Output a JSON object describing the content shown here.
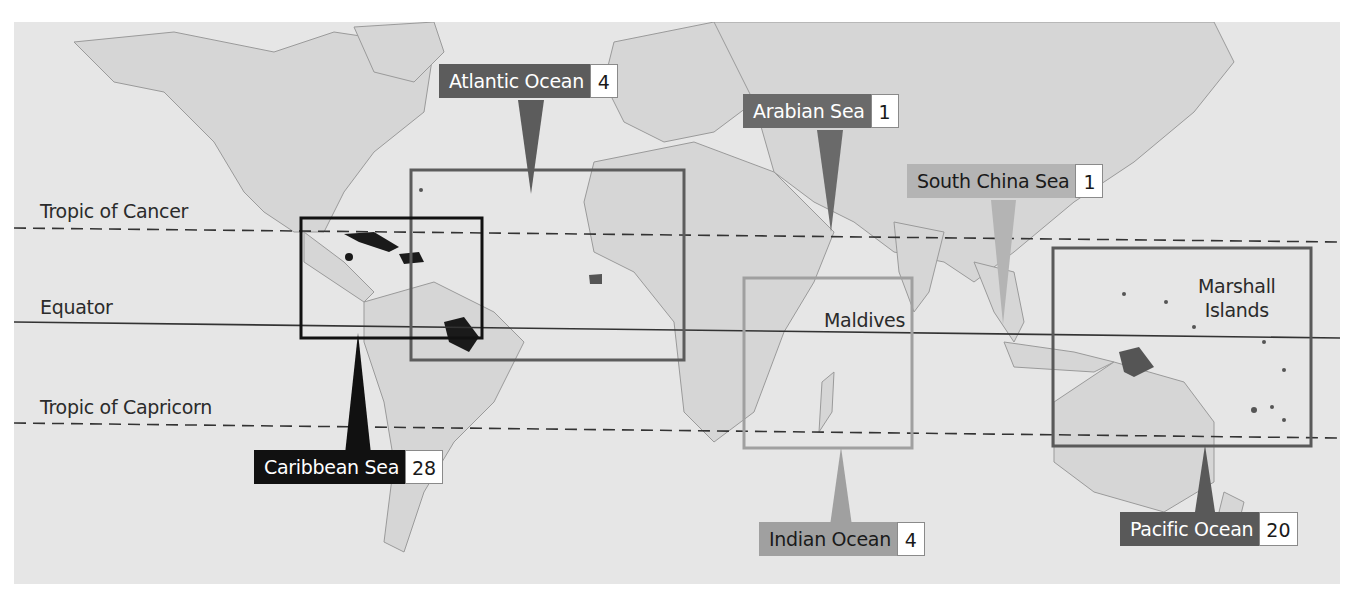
{
  "map": {
    "title": "",
    "background_color": "#e6e6e6",
    "land_color": "#d7d7d7",
    "lines": {
      "tropic_of_cancer": "Tropic of Cancer",
      "equator": "Equator",
      "tropic_of_capricorn": "Tropic of Capricorn"
    },
    "place_labels": {
      "maldives": "Maldives",
      "marshall_islands_line1": "Marshall",
      "marshall_islands_line2": "Islands"
    },
    "regions": [
      {
        "id": "atlantic",
        "name": "Atlantic Ocean",
        "count": "4",
        "color": "#5c5c5c"
      },
      {
        "id": "arabian",
        "name": "Arabian Sea",
        "count": "1",
        "color": "#6a6a6a"
      },
      {
        "id": "south_china",
        "name": "South China Sea",
        "count": "1",
        "color": "#b4b4b4"
      },
      {
        "id": "caribbean",
        "name": "Caribbean Sea",
        "count": "28",
        "color": "#111111"
      },
      {
        "id": "indian",
        "name": "Indian Ocean",
        "count": "4",
        "color": "#a0a0a0"
      },
      {
        "id": "pacific",
        "name": "Pacific Ocean",
        "count": "20",
        "color": "#595959"
      }
    ]
  }
}
